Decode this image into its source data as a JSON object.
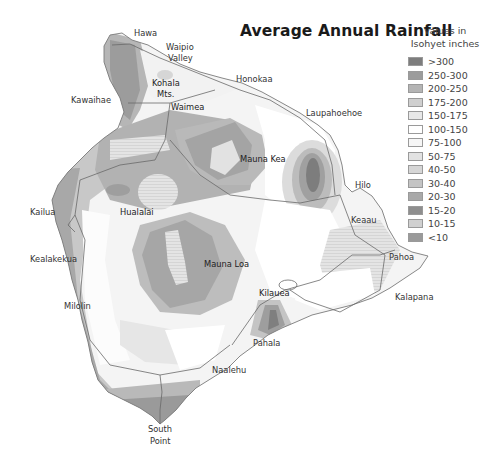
{
  "title": "Average Annual Rainfall",
  "legend": {
    "heading_line1": "Values in",
    "heading_line2": "Isohyet inches",
    "items": [
      {
        "label": ">300",
        "color": "#7d7d7d"
      },
      {
        "label": "250-300",
        "color": "#9c9c9c"
      },
      {
        "label": "200-250",
        "color": "#b4b4b4"
      },
      {
        "label": "175-200",
        "color": "#cfcfcf"
      },
      {
        "label": "150-175",
        "color": "#e8e8e8"
      },
      {
        "label": "100-150",
        "color": "#ffffff"
      },
      {
        "label": "75-100",
        "color": "#f6f6f6"
      },
      {
        "label": "50-75",
        "color": "#e2e2e2"
      },
      {
        "label": "40-50",
        "color": "#d6d6d6"
      },
      {
        "label": "30-40",
        "color": "#c4c4c4"
      },
      {
        "label": "20-30",
        "color": "#a9a9a9"
      },
      {
        "label": "15-20",
        "color": "#8e8e8e"
      },
      {
        "label": "10-15",
        "color": "#d0d0d0"
      },
      {
        "label": "<10",
        "color": "#9a9a9a"
      }
    ]
  },
  "places": {
    "hawa": "Hawa",
    "waipio_1": "Waipio",
    "waipio_2": "Valley",
    "honokaa": "Honokaa",
    "kohala_1": "Kohala",
    "kohala_2": "Mts.",
    "kawaihae": "Kawaihae",
    "waimea": "Waimea",
    "laupahoehoe": "Laupahoehoe",
    "mauna_kea": "Mauna Kea",
    "hilo": "Hilo",
    "kailua": "Kailua",
    "hualalai": "Hualalai",
    "keaau": "Keaau",
    "kealakekua": "Kealakekua",
    "mauna_loa": "Mauna Loa",
    "pahoa": "Pahoa",
    "milolin": "Milolin",
    "kilauea": "Kilauea",
    "kalapana": "Kalapana",
    "pahala": "Pahala",
    "naalehu": "Naalehu",
    "south_point_1": "South",
    "south_point_2": "Point"
  }
}
